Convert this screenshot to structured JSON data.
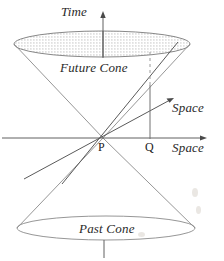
{
  "figure": {
    "title_text": "",
    "type": "light-cone-minkowski-spacetime-diagram",
    "background_color": "#ffffff",
    "line_color": "#8a8a8a",
    "text_color": "#2a2a2a"
  },
  "labels": {
    "time_axis": "Time",
    "future_cone": "Future Cone",
    "past_cone": "Past Cone",
    "space_axis_tilted": "Space",
    "space_axis_horizontal": "Space",
    "point_origin": "P",
    "point_q": "Q"
  },
  "geometry": {
    "origin_point": {
      "x": 103,
      "y": 138
    },
    "q_point": {
      "x": 150,
      "y": 138
    },
    "time_axis": {
      "x": 103,
      "y_top": 14,
      "y_bottom": 258
    },
    "horizontal_space_axis": {
      "y": 138,
      "x_left": 2,
      "x_right": 206
    },
    "tilted_space_axis": {
      "x1": 24,
      "y1": 179,
      "x2": 173,
      "y2": 99
    },
    "future_cone_ellipse": {
      "cx": 102,
      "cy": 44,
      "rx": 88,
      "ry": 13,
      "fill": "stippled"
    },
    "past_cone_ellipse": {
      "cx": 106,
      "cy": 228,
      "rx": 89,
      "ry": 12,
      "fill": "none"
    },
    "future_cone_edges": [
      {
        "x1": 103,
        "y1": 138,
        "x2": 14,
        "y2": 44
      },
      {
        "x1": 103,
        "y1": 138,
        "x2": 190,
        "y2": 44
      }
    ],
    "past_cone_edges": [
      {
        "x1": 103,
        "y1": 138,
        "x2": 17,
        "y2": 228
      },
      {
        "x1": 103,
        "y1": 138,
        "x2": 195,
        "y2": 228
      }
    ],
    "dashed_drop_line": {
      "x": 150,
      "y_top": 52,
      "y_bottom": 85
    },
    "solid_drop_line": {
      "x": 150,
      "y_top": 85,
      "y_bottom": 138
    },
    "bottom_tick": {
      "x": 104,
      "y_top": 240,
      "y_bottom": 258
    }
  },
  "icons": {
    "time_arrow": "arrow-up-icon",
    "space_arrow_horizontal": "arrow-right-icon",
    "space_arrow_tilted": "arrow-up-right-icon"
  }
}
